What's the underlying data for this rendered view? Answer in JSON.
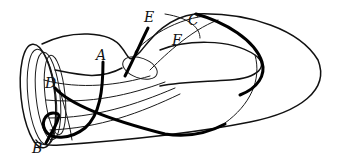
{
  "figure": {
    "labels": {
      "A": "A",
      "B": "B",
      "C": "C",
      "D": "D",
      "E": "E",
      "F": "F"
    },
    "colors": {
      "background": "#ffffff",
      "stroke": "#111111"
    }
  }
}
